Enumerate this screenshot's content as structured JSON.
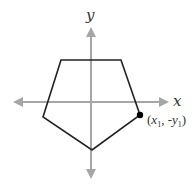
{
  "diagram": {
    "type": "coordinate-plane",
    "axes": {
      "x_label": "x",
      "y_label": "y",
      "color": "#a6a6a6"
    },
    "shape": {
      "name": "pentagon",
      "stroke": "#222222",
      "vertices": [
        [
          61,
          60
        ],
        [
          121,
          60
        ],
        [
          140,
          115
        ],
        [
          92,
          150
        ],
        [
          43,
          117
        ]
      ]
    },
    "point": {
      "label_open": "(",
      "x_var": "x",
      "x_sub": "1",
      "sep": ", -",
      "y_var": "y",
      "y_sub": "1",
      "label_close": ")",
      "color": "#000000"
    }
  }
}
